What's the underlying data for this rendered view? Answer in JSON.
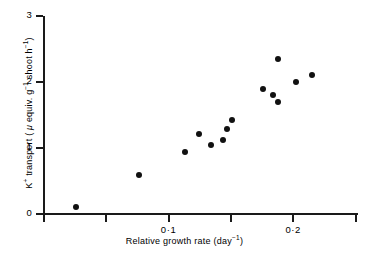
{
  "chart_data": {
    "type": "scatter",
    "title": "",
    "xlabel": "Relative growth rate (day⁻¹)",
    "ylabel": "K⁺ transport ( μ equiv. g⁻¹ shoot h⁻¹)",
    "xlim": [
      0.0,
      0.252
    ],
    "ylim": [
      0,
      3
    ],
    "grid": false,
    "legend": null,
    "x_ticks": [
      0.0,
      0.05,
      0.1,
      0.15,
      0.2,
      0.25
    ],
    "x_tick_labels": [
      "",
      "",
      "0·1",
      "",
      "0·2",
      ""
    ],
    "y_ticks": [
      0,
      1,
      2,
      3
    ],
    "y_tick_labels": [
      "0",
      "1",
      "2",
      "3"
    ],
    "marker": "filled-circle",
    "marker_color": "#111111",
    "points": [
      {
        "x": 0.026,
        "y": 0.11
      },
      {
        "x": 0.076,
        "y": 0.59
      },
      {
        "x": 0.113,
        "y": 0.94
      },
      {
        "x": 0.124,
        "y": 1.21
      },
      {
        "x": 0.134,
        "y": 1.05
      },
      {
        "x": 0.144,
        "y": 1.12
      },
      {
        "x": 0.147,
        "y": 1.29
      },
      {
        "x": 0.151,
        "y": 1.42
      },
      {
        "x": 0.176,
        "y": 1.89
      },
      {
        "x": 0.184,
        "y": 1.8
      },
      {
        "x": 0.188,
        "y": 1.7
      },
      {
        "x": 0.188,
        "y": 2.35
      },
      {
        "x": 0.202,
        "y": 2.0
      },
      {
        "x": 0.215,
        "y": 2.11
      }
    ]
  },
  "axes": {
    "y_label_parts": {
      "prefix": "K",
      "sup1": "+",
      "mid": " transport ( ",
      "mu": "μ",
      "mid2": " equiv. g",
      "sup2": "−1",
      "mid3": " shoot h",
      "sup3": "−1",
      "suffix": ")"
    },
    "x_label_parts": {
      "prefix": "Relative growth rate (day",
      "sup": "−1",
      "suffix": ")"
    }
  },
  "colors": {
    "background": "#ffffff",
    "axis": "#1a1a1a",
    "marker": "#111111"
  }
}
